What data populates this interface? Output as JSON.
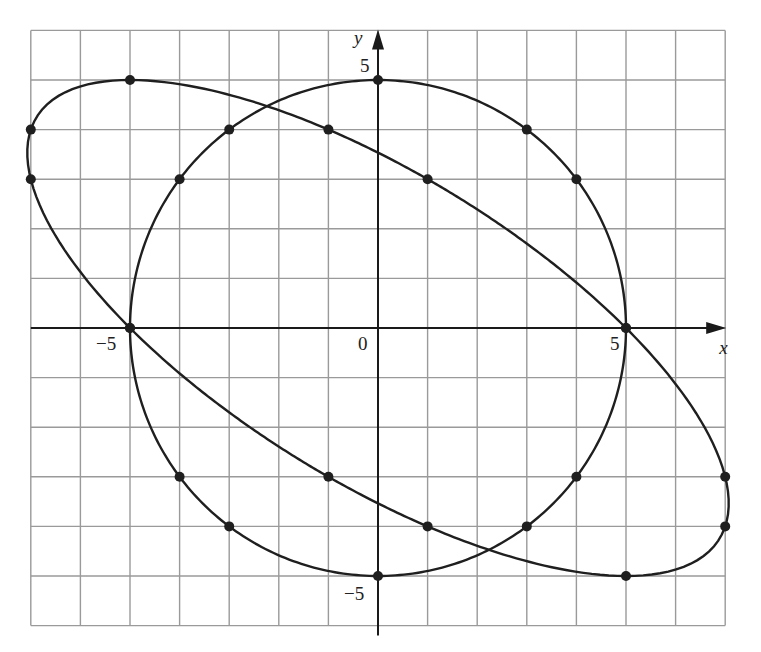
{
  "chart_data": {
    "type": "line",
    "title": "",
    "xlabel": "x",
    "ylabel": "y",
    "xlim": [
      -7,
      7
    ],
    "ylim": [
      -6,
      6
    ],
    "grid": true,
    "grid_step": 1,
    "tick_labels": {
      "x": [
        {
          "value": -5,
          "label": "−5"
        },
        {
          "value": 0,
          "label": "0"
        },
        {
          "value": 5,
          "label": "5"
        }
      ],
      "y": [
        {
          "value": 5,
          "label": "5"
        },
        {
          "value": -5,
          "label": "−5"
        }
      ]
    },
    "series": [
      {
        "name": "circle",
        "equation": "x^2 + y^2 = 25",
        "kind": "circle",
        "params": {
          "cx": 0,
          "cy": 0,
          "r": 5
        },
        "points": [
          [
            0,
            5
          ],
          [
            3,
            4
          ],
          [
            4,
            3
          ],
          [
            5,
            0
          ],
          [
            4,
            -3
          ],
          [
            3,
            -4
          ],
          [
            0,
            -5
          ],
          [
            -3,
            -4
          ],
          [
            -4,
            -3
          ],
          [
            -5,
            0
          ],
          [
            -4,
            3
          ],
          [
            -3,
            4
          ]
        ]
      },
      {
        "name": "rotated ellipse",
        "equation": "x^2 + 2xy + 2y^2 = 25",
        "kind": "conic",
        "params": {
          "A": 1,
          "B": 2,
          "C": 2,
          "F": 25
        },
        "points": [
          [
            -5,
            5
          ],
          [
            -7,
            4
          ],
          [
            -7,
            3
          ],
          [
            -5,
            0
          ],
          [
            -1,
            -3
          ],
          [
            1,
            -4
          ],
          [
            5,
            -5
          ],
          [
            7,
            -4
          ],
          [
            7,
            -3
          ],
          [
            5,
            0
          ],
          [
            1,
            3
          ],
          [
            -1,
            4
          ]
        ]
      }
    ]
  },
  "layout": {
    "origin_px": [
      378,
      328
    ],
    "cell_px": 49.6,
    "grid_left_px": 33,
    "grid_top_px": 30,
    "colors": {
      "grid": "#9a9a9a",
      "axis": "#1a1a1a",
      "curve": "#1f1f1f",
      "background": "#ffffff"
    }
  }
}
